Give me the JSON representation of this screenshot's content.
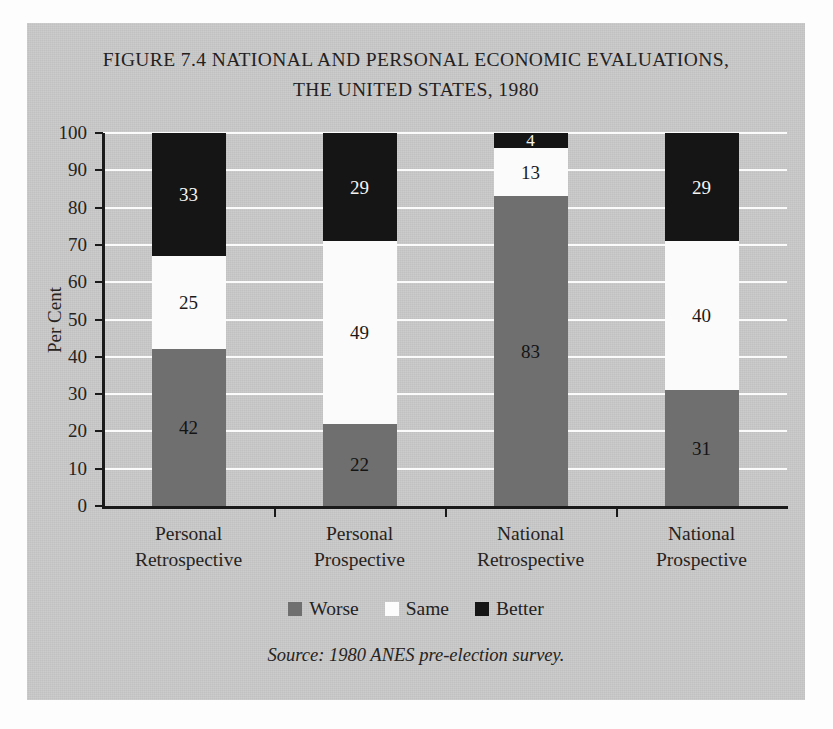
{
  "figure": {
    "title_line1": "FIGURE 7.4 NATIONAL AND PERSONAL ECONOMIC EVALUATIONS,",
    "title_line2": "THE UNITED STATES, 1980",
    "source_note": "Source: 1980 ANES pre-election survey."
  },
  "chart_data": {
    "type": "bar",
    "subtype": "stacked-bar-100",
    "title": "FIGURE 7.4 NATIONAL AND PERSONAL ECONOMIC EVALUATIONS, THE UNITED STATES, 1980",
    "xlabel": "",
    "ylabel": "Per Cent",
    "ylim": [
      0,
      100
    ],
    "ytick_step": 10,
    "ytick_labels": [
      "0",
      "10",
      "20",
      "30",
      "40",
      "50",
      "60",
      "70",
      "80",
      "90",
      "100"
    ],
    "grid": "horizontal",
    "legend_position": "bottom",
    "categories": [
      "Personal Retrospective",
      "Personal Prospective",
      "National Retrospective",
      "National Prospective"
    ],
    "category_lines": [
      [
        "Personal",
        "Retrospective"
      ],
      [
        "Personal",
        "Prospective"
      ],
      [
        "National",
        "Retrospective"
      ],
      [
        "National",
        "Prospective"
      ]
    ],
    "series": [
      {
        "name": "Worse",
        "color": "#6f6f6f",
        "values": [
          42,
          22,
          83,
          31
        ]
      },
      {
        "name": "Same",
        "color": "#fbfbfb",
        "values": [
          25,
          49,
          13,
          40
        ]
      },
      {
        "name": "Better",
        "color": "#151515",
        "values": [
          33,
          29,
          4,
          29
        ]
      }
    ],
    "stack_order_bottom_to_top": [
      "Worse",
      "Same",
      "Better"
    ]
  },
  "legend": {
    "items": [
      {
        "label": "Worse",
        "swatch": "gray-swatch"
      },
      {
        "label": "Same",
        "swatch": "white-swatch"
      },
      {
        "label": "Better",
        "swatch": "black-swatch"
      }
    ]
  },
  "colors": {
    "panel_background": "#c8c8c8",
    "page_background": "#fdfdfd",
    "gridline": "#fbfbfb",
    "axis": "#1a1a1a",
    "worse": "#6f6f6f",
    "same": "#fbfbfb",
    "better": "#151515"
  }
}
